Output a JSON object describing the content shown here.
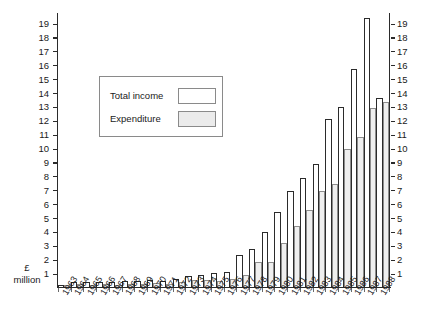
{
  "chart_data": {
    "type": "bar",
    "title": "",
    "subtitle": "",
    "xlabel": "",
    "ylabel": "£ million",
    "ylim": [
      0,
      19.8
    ],
    "ytick_step": 1,
    "yticks": [
      1,
      2,
      3,
      4,
      5,
      6,
      7,
      8,
      9,
      10,
      11,
      12,
      13,
      14,
      15,
      16,
      17,
      18,
      19
    ],
    "grid": false,
    "dual_y_axis": true,
    "legend_position": "upper-left-inset",
    "categories": [
      "1963",
      "1964",
      "1965",
      "1966",
      "1967",
      "1968",
      "1969",
      "1970",
      "1971",
      "1972",
      "1973",
      "1974",
      "1975",
      "1976",
      "1977",
      "1978",
      "1979",
      "1980",
      "1981",
      "1982",
      "1983",
      "1984",
      "1985",
      "1986",
      "1987",
      "1988"
    ],
    "series": [
      {
        "name": "Total income",
        "color": "#ffffff",
        "edge_color": "#2b2b2b",
        "values": [
          0.25,
          0.45,
          0.4,
          0.45,
          0.45,
          0.5,
          0.5,
          0.55,
          0.5,
          0.65,
          0.85,
          0.95,
          1.05,
          1.15,
          2.35,
          2.8,
          4.0,
          5.5,
          6.95,
          7.95,
          8.9,
          12.15,
          13.0,
          15.8,
          19.45,
          13.65
        ]
      },
      {
        "name": "Expenditure",
        "color": "#efefef",
        "edge_color": "#8d8d8d",
        "values": [
          0.2,
          0.3,
          0.25,
          0.3,
          0.25,
          0.3,
          0.3,
          0.35,
          0.3,
          0.4,
          0.55,
          0.6,
          0.5,
          0.65,
          0.95,
          1.85,
          1.85,
          3.25,
          4.5,
          5.6,
          7.0,
          7.5,
          10.0,
          10.85,
          12.95,
          13.4
        ]
      }
    ]
  },
  "axis": {
    "unit_currency": "£",
    "unit_denomination": "million"
  },
  "legend": {
    "income_label": "Total income",
    "expenditure_label": "Expenditure"
  }
}
